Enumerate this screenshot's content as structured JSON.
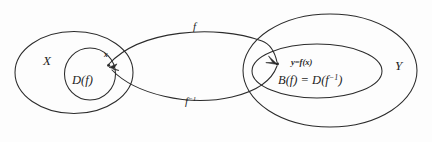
{
  "figure": {
    "background_color": "#fdfdfd",
    "stroke_color": "#2b2b2b",
    "sets": {
      "domain_set_label": "X",
      "codomain_set_label": "Y",
      "domain_subset_label": "D(f)",
      "codomain_subset_label": "B(f) = D(f⁻¹)",
      "codomain_subset_label_main": "B(f) = D(f",
      "codomain_subset_superscript": "−1",
      "codomain_subset_label_tail": ")"
    },
    "points": {
      "domain_point_label": "x",
      "codomain_point_label": "y=f(x)"
    },
    "maps": {
      "forward_label": "f",
      "inverse_label_base": "f",
      "inverse_label_superscript": "−1",
      "inverse_label": "f⁻¹"
    }
  }
}
